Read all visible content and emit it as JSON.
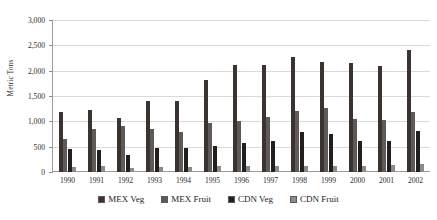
{
  "chart_data": {
    "type": "bar",
    "title": "",
    "xlabel": "",
    "ylabel": "Metric Tons",
    "ylim": [
      0,
      3000
    ],
    "ytick_values": [
      0,
      500,
      1000,
      1500,
      2000,
      2500,
      3000
    ],
    "ytick_labels": [
      "0",
      "500",
      "1,000",
      "1,500",
      "2,000",
      "2,500",
      "3,000"
    ],
    "grid": true,
    "legend_position": "bottom",
    "categories": [
      "1990",
      "1991",
      "1992",
      "1993",
      "1994",
      "1995",
      "1996",
      "1997",
      "1998",
      "1999",
      "2000",
      "2001",
      "2002"
    ],
    "series": [
      {
        "name": "MEX Veg",
        "color": "#3a3330",
        "values": [
          1190,
          1220,
          1060,
          1400,
          1400,
          1810,
          2120,
          2120,
          2270,
          2180,
          2160,
          2100,
          2410
        ]
      },
      {
        "name": "MEX Fruit",
        "color": "#5f5a57",
        "values": [
          660,
          840,
          910,
          840,
          790,
          960,
          1000,
          1080,
          1210,
          1260,
          1050,
          1030,
          1180
        ]
      },
      {
        "name": "CDN Veg",
        "color": "#231f1e",
        "values": [
          450,
          430,
          330,
          480,
          480,
          510,
          580,
          620,
          780,
          750,
          620,
          610,
          800
        ]
      },
      {
        "name": "CDN Fruit",
        "color": "#8e8a87",
        "values": [
          90,
          110,
          80,
          90,
          100,
          110,
          120,
          120,
          120,
          120,
          120,
          130,
          150
        ]
      }
    ]
  }
}
